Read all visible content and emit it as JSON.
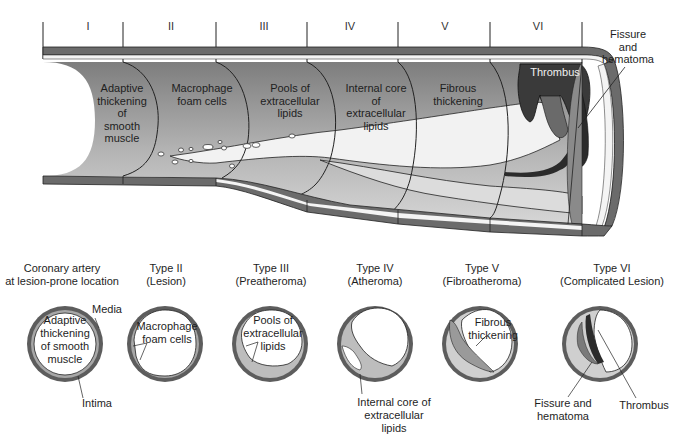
{
  "figure": {
    "stages": [
      {
        "numeral": "I",
        "label": "Adaptive\nthickening\nof\nsmooth\nmuscle"
      },
      {
        "numeral": "II",
        "label": "Macrophage\nfoam cells"
      },
      {
        "numeral": "III",
        "label": "Pools of\nextracellular\nlipids"
      },
      {
        "numeral": "IV",
        "label": "Internal core\nof\nextracellular\nlipids"
      },
      {
        "numeral": "V",
        "label": "Fibrous\nthickening"
      },
      {
        "numeral": "VI",
        "label": "Thrombus"
      }
    ],
    "side_callout": "Fissure\nand\nhematoma"
  },
  "cross_sections": [
    {
      "title": "Coronary artery\nat lesion-prone location",
      "inner": "Adaptive\nthickening\nof smooth\nmuscle",
      "callouts": [
        "Media",
        "Intima"
      ]
    },
    {
      "title": "Type II\n(Lesion)",
      "inner": "Macrophage\nfoam cells"
    },
    {
      "title": "Type III\n(Preatheroma)",
      "inner": "Pools of\nextracellular\nlipids"
    },
    {
      "title": "Type IV\n(Atheroma)",
      "callout": "Internal core of\nextracellular\nlipids"
    },
    {
      "title": "Type V\n(Fibroatheroma)",
      "inner": "Fibrous\nthickening"
    },
    {
      "title": "Type VI\n(Complicated Lesion)",
      "callouts": [
        "Fissure and\nhematoma",
        "Thrombus"
      ]
    }
  ],
  "colors": {
    "wall_dark": "#5a5a5a",
    "wall_mid": "#8c8c8c",
    "intima_gray": "#a8a8a8",
    "plaque_light": "#d9d9d9",
    "thrombus_dark": "#2e2e2e",
    "background": "#ffffff"
  }
}
